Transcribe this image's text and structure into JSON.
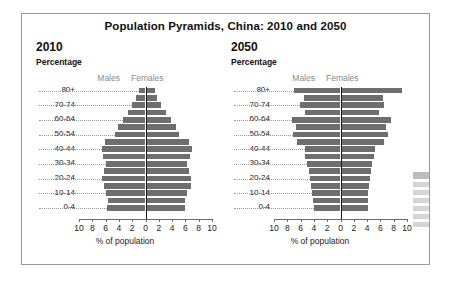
{
  "figure": {
    "title": "Population Pyramids, China: 2010 and 2050",
    "axis_title": "% of population",
    "subtitle": "Percentage",
    "series_labels": {
      "males": "Males",
      "females": "Females"
    },
    "bar_color": "#6e6e6e",
    "axis_color": "#6a6a6a",
    "sex_label_color": "#8a8a8a",
    "border_color": "#9a9a9a"
  },
  "chart_data": [
    {
      "type": "bar",
      "title": "2010",
      "subtitle": "Percentage",
      "xlabel": "% of population",
      "ylabel": "",
      "xlim": [
        -10,
        10
      ],
      "xticks": [
        10,
        8,
        6,
        4,
        2,
        0,
        2,
        4,
        6,
        8,
        10
      ],
      "grid": false,
      "legend_position": "top-center",
      "categories": [
        "80+",
        "75-79",
        "70-74",
        "65-69",
        "60-64",
        "55-59",
        "50-54",
        "45-49",
        "40-44",
        "35-39",
        "30-34",
        "25-29",
        "20-24",
        "15-19",
        "10-14",
        "5-9",
        "0-4"
      ],
      "displayed_ticklabels": [
        "80+",
        "",
        "70-74",
        "",
        "60-64",
        "",
        "50-54",
        "",
        "40-44",
        "",
        "30-34",
        "",
        "20-24",
        "",
        "10-14",
        "",
        "0-4"
      ],
      "series": [
        {
          "name": "Males",
          "values": [
            1.0,
            1.4,
            2.0,
            2.6,
            3.4,
            4.2,
            4.6,
            6.1,
            6.6,
            6.4,
            5.9,
            6.2,
            6.5,
            6.3,
            5.9,
            5.6,
            5.8
          ]
        },
        {
          "name": "Females",
          "values": [
            1.4,
            1.7,
            2.4,
            3.1,
            3.9,
            4.6,
            5.0,
            6.6,
            7.0,
            6.7,
            6.2,
            6.6,
            6.9,
            6.8,
            6.3,
            5.9,
            6.0
          ]
        }
      ]
    },
    {
      "type": "bar",
      "title": "2050",
      "subtitle": "Percentage",
      "xlabel": "% of population",
      "ylabel": "",
      "xlim": [
        -10,
        10
      ],
      "xticks": [
        10,
        8,
        6,
        4,
        2,
        0,
        2,
        4,
        6,
        8,
        10
      ],
      "grid": false,
      "legend_position": "top-center",
      "categories": [
        "80+",
        "75-79",
        "70-74",
        "65-69",
        "60-64",
        "55-59",
        "50-54",
        "45-49",
        "40-44",
        "35-39",
        "30-34",
        "25-29",
        "20-24",
        "15-19",
        "10-14",
        "5-9",
        "0-4"
      ],
      "displayed_ticklabels": [
        "80+",
        "",
        "70-74",
        "",
        "60-64",
        "",
        "50-54",
        "",
        "40-44",
        "",
        "30-34",
        "",
        "20-24",
        "",
        "10-14",
        "",
        "0-4"
      ],
      "series": [
        {
          "name": "Males",
          "values": [
            7.0,
            5.5,
            6.1,
            5.4,
            7.3,
            6.7,
            7.2,
            6.6,
            5.4,
            5.3,
            5.0,
            4.8,
            4.6,
            4.4,
            4.3,
            4.2,
            4.0
          ]
        },
        {
          "name": "Females",
          "values": [
            9.2,
            6.4,
            6.6,
            5.8,
            7.6,
            6.9,
            7.2,
            6.6,
            5.2,
            5.1,
            4.8,
            4.6,
            4.4,
            4.3,
            4.2,
            4.1,
            4.1
          ]
        }
      ]
    }
  ]
}
